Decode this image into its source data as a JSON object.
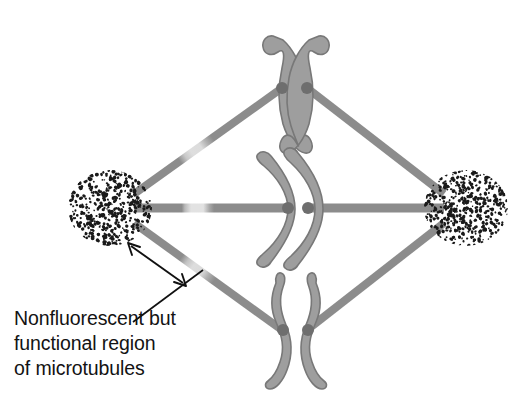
{
  "figure": {
    "background_color": "#ffffff"
  },
  "colors": {
    "microtubule_fluorescent": "#8c8c8c",
    "microtubule_bleached": "#d8d8d8",
    "microtubule_bleached_edge": "#bdbdbd",
    "chromosome_fill": "#9e9e9e",
    "chromosome_stroke": "#787878",
    "centromere": "#6e6e6e",
    "pole_speckle": "#1a1a1a",
    "annotation_line": "#111111",
    "caption_text": "#131313"
  },
  "annotation": {
    "name": "nonfluorescent-region-callout",
    "caption_lines": [
      "Nonfluorescent but",
      "functional region",
      "of microtubules"
    ],
    "caption_full": "Nonfluorescent but functional region of microtubules",
    "arrow_type": "double-headed",
    "arrow_start": {
      "x": 128,
      "y": 243
    },
    "arrow_end": {
      "x": 186,
      "y": 286
    },
    "leader_start": {
      "x": 133,
      "y": 322
    },
    "leader_end": {
      "x": 202,
      "y": 271
    }
  },
  "poles": [
    {
      "name": "spindle-pole-left",
      "label": "left pole",
      "cx": 110,
      "cy": 208,
      "rx": 42,
      "ry": 38,
      "speckle_count": 430
    },
    {
      "name": "spindle-pole-right",
      "label": "right pole",
      "cx": 466,
      "cy": 208,
      "rx": 42,
      "ry": 38,
      "speckle_count": 430
    }
  ],
  "microtubule_bundles": [
    {
      "name": "bundle-upper-left",
      "from": {
        "x": 134,
        "y": 194
      },
      "to": {
        "x": 282,
        "y": 88
      },
      "width": 8,
      "bleached": true,
      "bleach_from": 0.33,
      "bleach_to": 0.47
    },
    {
      "name": "bundle-middle-left",
      "from": {
        "x": 134,
        "y": 208
      },
      "to": {
        "x": 288,
        "y": 208
      },
      "width": 9,
      "bleached": true,
      "bleach_from": 0.33,
      "bleach_to": 0.48
    },
    {
      "name": "bundle-lower-left",
      "from": {
        "x": 134,
        "y": 223
      },
      "to": {
        "x": 282,
        "y": 330
      },
      "width": 8,
      "bleached": true,
      "bleach_from": 0.34,
      "bleach_to": 0.49
    },
    {
      "name": "bundle-upper-right",
      "from": {
        "x": 444,
        "y": 194
      },
      "to": {
        "x": 307,
        "y": 88
      },
      "width": 8,
      "bleached": false,
      "bleach_from": 0,
      "bleach_to": 0
    },
    {
      "name": "bundle-middle-right",
      "from": {
        "x": 444,
        "y": 208
      },
      "to": {
        "x": 307,
        "y": 208
      },
      "width": 9,
      "bleached": false,
      "bleach_from": 0,
      "bleach_to": 0
    },
    {
      "name": "bundle-lower-right",
      "from": {
        "x": 444,
        "y": 223
      },
      "to": {
        "x": 307,
        "y": 330
      },
      "width": 8,
      "bleached": false,
      "bleach_from": 0,
      "bleach_to": 0
    }
  ],
  "chromosomes": [
    {
      "name": "chromosome-top",
      "shape": "crossed-x",
      "center": {
        "x": 295,
        "y": 88
      },
      "centromere_left": {
        "x": 282,
        "y": 88
      },
      "centromere_right": {
        "x": 307,
        "y": 88
      }
    },
    {
      "name": "chromosome-middle",
      "shape": "double-crescent",
      "center": {
        "x": 297,
        "y": 208
      },
      "centromere_left": {
        "x": 288,
        "y": 208
      },
      "centromere_right": {
        "x": 307,
        "y": 208
      }
    },
    {
      "name": "chromosome-bottom",
      "shape": "mirrored-curve",
      "center": {
        "x": 295,
        "y": 330
      },
      "centromere_left": {
        "x": 282,
        "y": 330
      },
      "centromere_right": {
        "x": 307,
        "y": 330
      }
    }
  ]
}
